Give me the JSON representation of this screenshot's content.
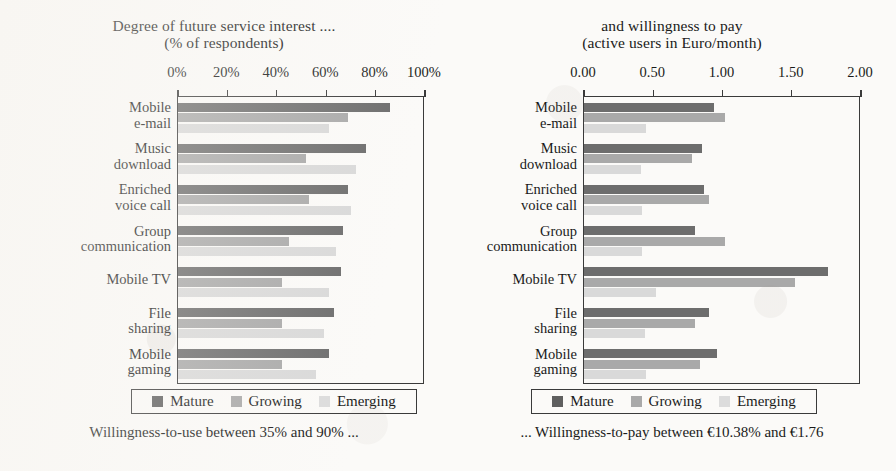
{
  "figure": {
    "panels": [
      {
        "id": "left",
        "title_line1": "Degree of future service interest ....",
        "title_line2": "(% of respondents)",
        "caption": "Willingness-to-use between 35% and 90% ..."
      },
      {
        "id": "right",
        "title_line1": "and willingness to pay",
        "title_line2": "(active users in Euro/month)",
        "caption": "... Willingness-to-pay between €10.38% and €1.76"
      }
    ],
    "legend": {
      "items": [
        {
          "label": "Mature",
          "color": "#5f5f5f",
          "swatch_name": "legend-swatch-mature"
        },
        {
          "label": "Growing",
          "color": "#a9a9a9",
          "swatch_name": "legend-swatch-growing"
        },
        {
          "label": "Emerging",
          "color": "#dcdcdc",
          "swatch_name": "legend-swatch-emerging"
        }
      ]
    }
  },
  "chart_data": [
    {
      "type": "bar",
      "orientation": "horizontal",
      "title": "Degree of future service interest .... (% of respondents)",
      "xlabel": "% of respondents",
      "ylabel": "",
      "xlim": [
        0,
        100
      ],
      "xticks": [
        0,
        20,
        40,
        60,
        80,
        100
      ],
      "xticklabels": [
        "0%",
        "20%",
        "40%",
        "60%",
        "80%",
        "100%"
      ],
      "grid": false,
      "legend_position": "bottom",
      "categories": [
        "Mobile\ne-mail",
        "Music\ndownload",
        "Enriched\nvoice call",
        "Group\ncommunication",
        "Mobile TV",
        "File\nsharing",
        "Mobile\ngaming"
      ],
      "series": [
        {
          "name": "Mature",
          "color": "#6d6d6d",
          "values": [
            86,
            76,
            69,
            67,
            66,
            63,
            61
          ]
        },
        {
          "name": "Growing",
          "color": "#a9a9a9",
          "values": [
            69,
            52,
            53,
            45,
            42,
            42,
            42
          ]
        },
        {
          "name": "Emerging",
          "color": "#d9d9d9",
          "values": [
            61,
            72,
            70,
            64,
            61,
            59,
            56
          ]
        }
      ],
      "annotation": "Willingness-to-use between 35% and 90% ..."
    },
    {
      "type": "bar",
      "orientation": "horizontal",
      "title": "and willingness to pay (active users in Euro/month)",
      "xlabel": "Euro/month",
      "ylabel": "",
      "xlim": [
        0.0,
        2.0
      ],
      "xticks": [
        0.0,
        0.5,
        1.0,
        1.5,
        2.0
      ],
      "xticklabels": [
        "0.00",
        "0.50",
        "1.00",
        "1.50",
        "2.00"
      ],
      "grid": false,
      "legend_position": "bottom",
      "categories": [
        "Mobile\ne-mail",
        "Music\ndownload",
        "Enriched\nvoice call",
        "Group\ncommunication",
        "Mobile TV",
        "File\nsharing",
        "Mobile\ngaming"
      ],
      "series": [
        {
          "name": "Mature",
          "color": "#6d6d6d",
          "values": [
            0.94,
            0.85,
            0.87,
            0.8,
            1.76,
            0.9,
            0.96
          ]
        },
        {
          "name": "Growing",
          "color": "#a9a9a9",
          "values": [
            1.02,
            0.78,
            0.9,
            1.02,
            1.52,
            0.8,
            0.84
          ]
        },
        {
          "name": "Emerging",
          "color": "#d9d9d9",
          "values": [
            0.45,
            0.41,
            0.42,
            0.42,
            0.52,
            0.44,
            0.45
          ]
        }
      ],
      "annotation": "... Willingness-to-pay between €10.38% and €1.76"
    }
  ]
}
